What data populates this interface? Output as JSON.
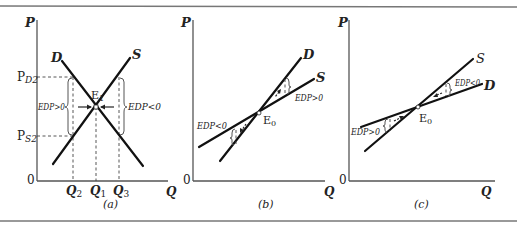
{
  "figure": {
    "colors": {
      "curve": "#111111",
      "axis": "#555555",
      "rule": "#777777",
      "text": "#222222"
    },
    "panels": [
      {
        "id": "a",
        "caption": "(a)",
        "y_axis_label": "P",
        "x_axis_label": "Q",
        "origin_label": "0",
        "demand_label": "D",
        "supply_label": "S",
        "equilibrium_label": "E",
        "equilibrium_sub": "1",
        "price_ticks": [
          {
            "main": "P",
            "sub": "D2"
          },
          {
            "main": "P",
            "sub": "S2"
          }
        ],
        "quantity_ticks": [
          {
            "main": "Q",
            "sub": "2"
          },
          {
            "main": "Q",
            "sub": "1"
          },
          {
            "main": "Q",
            "sub": "3"
          }
        ],
        "edp_left": "EDP>0",
        "edp_right": "EDP<0"
      },
      {
        "id": "b",
        "caption": "(b)",
        "y_axis_label": "P",
        "x_axis_label": "Q",
        "origin_label": "0",
        "demand_label": "D",
        "supply_label": "S",
        "equilibrium_label": "E",
        "equilibrium_sub": "0",
        "edp_upper": "EDP>0",
        "edp_lower": "EDP<0"
      },
      {
        "id": "c",
        "caption": "(c)",
        "y_axis_label": "P",
        "x_axis_label": "Q",
        "origin_label": "0",
        "demand_label": "D",
        "supply_label": "S",
        "equilibrium_label": "E",
        "equilibrium_sub": "0",
        "edp_upper": "EDP<0",
        "edp_lower": "EDP>0"
      }
    ]
  }
}
